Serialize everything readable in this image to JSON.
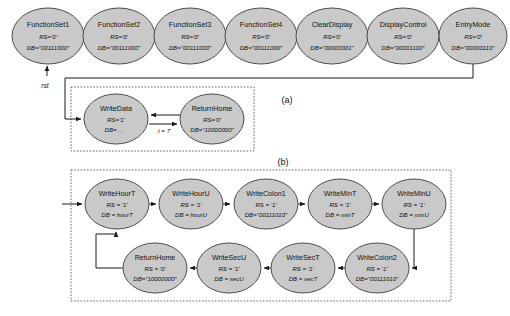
{
  "figure": {
    "captions": [
      {
        "id": "caption-a",
        "text": "(a)",
        "x": 287,
        "y": 100
      },
      {
        "id": "caption-b",
        "text": "(b)",
        "x": 283,
        "y": 163
      }
    ],
    "reset_label": "rst"
  },
  "diagram_data": {
    "type": "state-machine",
    "panels": [
      {
        "id": "panel-a",
        "caption": "(a)",
        "description": "LCD initialization sequence and write/return-home loop"
      },
      {
        "id": "panel-b",
        "caption": "(b)",
        "description": "Clock digit write sequence loop"
      }
    ],
    "init_states": [
      {
        "id": "FunctionSet1",
        "title": "FunctionSet1",
        "rs": "RS='0'",
        "db": "DB=\"00111000\"",
        "cx": 48,
        "cy": 36,
        "rx": 36,
        "ry": 28
      },
      {
        "id": "FunctionSet2",
        "title": "FunctionSet2",
        "rs": "RS='0'",
        "db": "DB=\"00111000\"",
        "cx": 119,
        "cy": 36,
        "rx": 36,
        "ry": 28
      },
      {
        "id": "FunctionSet3",
        "title": "FunctionSet3",
        "rs": "RS='0'",
        "db": "DB=\"00111000\"",
        "cx": 190,
        "cy": 36,
        "rx": 36,
        "ry": 28
      },
      {
        "id": "FunctionSet4",
        "title": "FunctionSet4",
        "rs": "RS='0'",
        "db": "DB=\"00111000\"",
        "cx": 261,
        "cy": 36,
        "rx": 36,
        "ry": 28
      },
      {
        "id": "ClearDisplay",
        "title": "ClearDisplay",
        "rs": "RS='0'",
        "db": "DB=\"00000001\"",
        "cx": 332,
        "cy": 36,
        "rx": 36,
        "ry": 28
      },
      {
        "id": "DisplayControl",
        "title": "DisplayControl",
        "rs": "RS='0'",
        "db": "DB=\"00001100\"",
        "cx": 403,
        "cy": 36,
        "rx": 36,
        "ry": 28
      },
      {
        "id": "EntryMode",
        "title": "EntryMode",
        "rs": "RS='0'",
        "db": "DB=\"00000110\"",
        "cx": 473,
        "cy": 36,
        "rx": 34,
        "ry": 28
      }
    ],
    "write_states": [
      {
        "id": "WriteData",
        "title": "WriteData",
        "rs": "RS='1'",
        "db": "DB= ...",
        "cx": 116,
        "cy": 119,
        "rx": 32,
        "ry": 25
      },
      {
        "id": "ReturnHomeA",
        "title": "ReturnHome",
        "rs": "RS='0'",
        "db": "DB=\"10000000\"",
        "cx": 212,
        "cy": 119,
        "rx": 32,
        "ry": 25
      }
    ],
    "clock_states_top": [
      {
        "id": "WriteHourT",
        "title": "WriteHourT",
        "rs": "RS = '1'",
        "db": "DB = hourT",
        "cx": 117,
        "cy": 204,
        "rx": 32,
        "ry": 25
      },
      {
        "id": "WriteHourU",
        "title": "WriteHourU",
        "rs": "RS = '1'",
        "db": "DB = hourU",
        "cx": 191,
        "cy": 204,
        "rx": 32,
        "ry": 25
      },
      {
        "id": "WriteColon1",
        "title": "WriteColon1",
        "rs": "RS = '1'",
        "db": "DB=\"00111010\"",
        "cx": 266,
        "cy": 204,
        "rx": 32,
        "ry": 25
      },
      {
        "id": "WriteMinT",
        "title": "WriteMinT",
        "rs": "RS = '1'",
        "db": "DB = minT",
        "cx": 340,
        "cy": 204,
        "rx": 32,
        "ry": 25
      },
      {
        "id": "WriteMinU",
        "title": "WriteMinU",
        "rs": "RS = '1'",
        "db": "DB = minU",
        "cx": 414,
        "cy": 204,
        "rx": 32,
        "ry": 25
      }
    ],
    "clock_states_bottom": [
      {
        "id": "ReturnHomeB",
        "title": "ReturnHome",
        "rs": "RS = '0'",
        "db": "DB=\"10000000\"",
        "cx": 155,
        "cy": 268,
        "rx": 32,
        "ry": 25
      },
      {
        "id": "WriteSecU",
        "title": "WriteSecU",
        "rs": "RS = '1'",
        "db": "DB = secU",
        "cx": 229,
        "cy": 268,
        "rx": 32,
        "ry": 25
      },
      {
        "id": "WriteSecT",
        "title": "WriteSecT",
        "rs": "RS = '1'",
        "db": "DB = secT",
        "cx": 303,
        "cy": 268,
        "rx": 32,
        "ry": 25
      },
      {
        "id": "WriteColon2",
        "title": "WriteColon2",
        "rs": "RS = '1'",
        "db": "DB=\"00111010\"",
        "cx": 377,
        "cy": 268,
        "rx": 32,
        "ry": 25
      }
    ],
    "edge_labels": [
      {
        "id": "t-equals-7",
        "text": "t = 7",
        "x": 164,
        "y": 132
      }
    ],
    "transitions": [
      {
        "from": "FunctionSet1",
        "to": "FunctionSet2"
      },
      {
        "from": "FunctionSet2",
        "to": "FunctionSet3"
      },
      {
        "from": "FunctionSet3",
        "to": "FunctionSet4"
      },
      {
        "from": "FunctionSet4",
        "to": "ClearDisplay"
      },
      {
        "from": "ClearDisplay",
        "to": "DisplayControl"
      },
      {
        "from": "DisplayControl",
        "to": "EntryMode"
      },
      {
        "from": "EntryMode",
        "to": "WriteData"
      },
      {
        "from": "WriteData",
        "to": "ReturnHomeA",
        "label": "t = 7"
      },
      {
        "from": "ReturnHomeA",
        "to": "WriteData"
      },
      {
        "from": "WriteHourT",
        "to": "WriteHourU"
      },
      {
        "from": "WriteHourU",
        "to": "WriteColon1"
      },
      {
        "from": "WriteColon1",
        "to": "WriteMinT"
      },
      {
        "from": "WriteMinT",
        "to": "WriteMinU"
      },
      {
        "from": "WriteMinU",
        "to": "WriteColon2"
      },
      {
        "from": "WriteColon2",
        "to": "WriteSecT"
      },
      {
        "from": "WriteSecT",
        "to": "WriteSecU"
      },
      {
        "from": "WriteSecU",
        "to": "ReturnHomeB"
      },
      {
        "from": "ReturnHomeB",
        "to": "WriteHourT"
      }
    ],
    "reset_arrow": {
      "label": "rst",
      "target": "FunctionSet1"
    },
    "colors": {
      "node_fill": "#c9c9c9",
      "node_stroke": "#4d4d4d",
      "edge": "#1a1a1a",
      "panel_border": "#555555",
      "background": "#ffffff",
      "text": "#111111"
    }
  }
}
